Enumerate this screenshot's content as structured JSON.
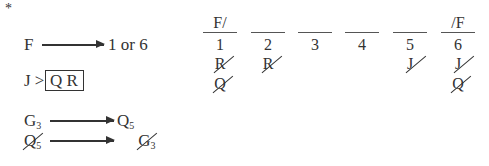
{
  "marker": "*",
  "rules": {
    "rule1": {
      "left": "F",
      "right": "1 or 6"
    },
    "rule2": {
      "left": "J >",
      "block": "Q R"
    },
    "rule3": {
      "left": "G",
      "left_sub": "3",
      "right": "Q",
      "right_sub": "5"
    },
    "rule4": {
      "left": "Q",
      "left_sub": "5",
      "right": "G",
      "right_sub": "3",
      "crossed": true
    }
  },
  "slots": [
    {
      "label": "F/",
      "number": "1",
      "crossed_out": [
        "R",
        "Q"
      ]
    },
    {
      "label": "",
      "number": "2",
      "crossed_out": [
        "R"
      ]
    },
    {
      "label": "",
      "number": "3",
      "crossed_out": []
    },
    {
      "label": "",
      "number": "4",
      "crossed_out": []
    },
    {
      "label": "",
      "number": "5",
      "crossed_out": [
        "J"
      ]
    },
    {
      "label": "/F",
      "number": "6",
      "crossed_out": [
        "J",
        "Q"
      ]
    }
  ],
  "colors": {
    "ink": "#333333",
    "background": "#ffffff"
  }
}
